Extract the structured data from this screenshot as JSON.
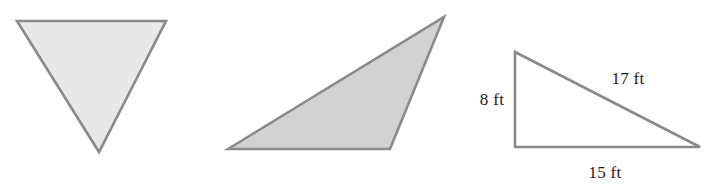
{
  "figure": {
    "title": "",
    "background_color": "#ffffff",
    "stroke_color": "#8a8a8a",
    "label_color": "#1a1a1a",
    "shapes": [
      {
        "name": "inverted-triangle",
        "kind": "triangle",
        "orientation": "inverted",
        "filled": true,
        "fill_color": "#e8e8e8",
        "points": "17,21 166,21 99,152",
        "labels": []
      },
      {
        "name": "obtuse-triangle",
        "kind": "triangle",
        "orientation": "obtuse-right-apex",
        "filled": true,
        "fill_color": "#d2d2d2",
        "points": "228,149 444,17 390,149",
        "labels": []
      },
      {
        "name": "right-triangle",
        "kind": "triangle",
        "orientation": "right-angle-bottom-left",
        "filled": false,
        "fill_color": "none",
        "points": "515,52 515,147 700,147",
        "labels": [
          {
            "name": "leg-vertical",
            "text": "8 ft",
            "x": 492,
            "y": 105,
            "anchor": "middle"
          },
          {
            "name": "hypotenuse",
            "text": "17 ft",
            "x": 628,
            "y": 84,
            "anchor": "middle"
          },
          {
            "name": "leg-horizontal",
            "text": "15 ft",
            "x": 605,
            "y": 178,
            "anchor": "middle"
          }
        ]
      }
    ]
  }
}
